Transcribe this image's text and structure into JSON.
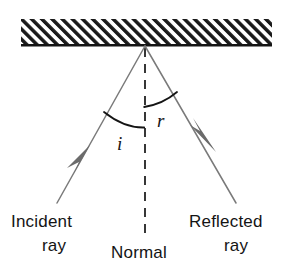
{
  "diagram": {
    "type": "ray-diagram",
    "colors": {
      "ink": "#141414",
      "ray": "#6e6e6e",
      "arrow": "#6b6b6b",
      "background": "#ffffff",
      "hatch": "#1a1a1a"
    },
    "surface": {
      "name": "mirror-surface",
      "hatching": "diagonal-lines-lower-left-to-upper-right",
      "baseline_y": 45,
      "x_start": 21,
      "x_end": 272,
      "band_height": 26
    },
    "point_of_incidence": {
      "x": 145,
      "y": 46
    },
    "rays": [
      {
        "id": "incident",
        "label_line1": "Incident",
        "label_line2": "ray",
        "from": {
          "x": 57,
          "y": 203
        },
        "to": {
          "x": 145,
          "y": 46
        },
        "arrow_direction": "toward-mirror",
        "arrow_at": {
          "x": 82,
          "y": 158
        }
      },
      {
        "id": "reflected",
        "label_line1": "Reflected",
        "label_line2": "ray",
        "from": {
          "x": 145,
          "y": 46
        },
        "to": {
          "x": 236,
          "y": 203
        },
        "arrow_direction": "away-from-mirror",
        "arrow_at": {
          "x": 203,
          "y": 138
        }
      }
    ],
    "normal": {
      "label": "Normal",
      "style": "dashed",
      "x": 145,
      "y_top": 48,
      "y_bottom": 238
    },
    "angles": [
      {
        "id": "angle-of-incidence",
        "symbol": "i",
        "label_x": 118,
        "label_y": 149,
        "arc_from": {
          "x": 104,
          "y": 112
        },
        "arc_to": {
          "x": 144,
          "y": 128
        }
      },
      {
        "id": "angle-of-reflection",
        "symbol": "r",
        "label_x": 158,
        "label_y": 126,
        "arc_from": {
          "x": 144,
          "y": 107
        },
        "arc_to": {
          "x": 176,
          "y": 93
        }
      }
    ],
    "labels": {
      "incident_line1": "Incident",
      "incident_line2": "ray",
      "normal": "Normal",
      "reflected_line1": "Reflected",
      "reflected_line2": "ray",
      "angle_i": "i",
      "angle_r": "r"
    }
  }
}
